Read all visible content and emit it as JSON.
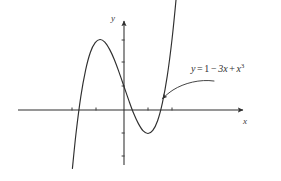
{
  "figure": {
    "title": "",
    "background_color": "#ffffff",
    "stroke_color": "#2f2f2f",
    "width": 281,
    "height": 181
  },
  "axes": {
    "x_label": "x",
    "y_label": "y",
    "origin_px": {
      "x": 124,
      "y": 110
    },
    "x_axis_px": {
      "start_x": 18,
      "end_x": 246,
      "y": 110
    },
    "y_axis_px": {
      "x": 124,
      "start_y": 165,
      "end_y": 18
    },
    "x_tick_px": [
      72,
      96,
      148,
      172
    ],
    "y_tick_px": [
      40,
      62,
      86,
      133,
      156
    ],
    "arrowheads": [
      "x-positive",
      "y-positive"
    ],
    "grid": false
  },
  "annotation": {
    "equation_text": "y = 1 - 3x + x^3",
    "lhs": "y",
    "equals": "=",
    "term_constant": "1",
    "term_linear": "3x",
    "term_cubic": "x",
    "cubic_exponent": "3",
    "minus_sign": "−",
    "plus_sign": "+",
    "pointer": "curved-arrow",
    "pointer_tip_px": {
      "x": 161,
      "y": 100
    }
  },
  "chart_data": {
    "type": "line",
    "title": "",
    "xlabel": "x",
    "ylabel": "y",
    "equation": "y = 1 - 3x + x^3",
    "grid": false,
    "legend": "none",
    "annotations": [
      {
        "text": "y = 1 - 3x + x^3",
        "x": 2.0,
        "y": 3.0
      }
    ],
    "xlim": [
      -2.3,
      2.6
    ],
    "ylim": [
      -3.4,
      4.0
    ],
    "features": {
      "local_max": {
        "x": -1,
        "y": 3
      },
      "local_min": {
        "x": 1,
        "y": -1
      },
      "y_intercept": {
        "x": 0,
        "y": 1
      },
      "inflection": {
        "x": 0,
        "y": 1
      }
    },
    "series": [
      {
        "name": "y = 1 - 3x + x^3",
        "color": "#2f2f2f",
        "x": [
          -2.15,
          -2.0,
          -1.8,
          -1.6,
          -1.4,
          -1.2,
          -1.0,
          -0.8,
          -0.6,
          -0.4,
          -0.2,
          0.0,
          0.2,
          0.4,
          0.6,
          0.8,
          1.0,
          1.2,
          1.4,
          1.6,
          1.8,
          2.0,
          2.2,
          2.35
        ],
        "y": [
          -2.49,
          -1.0,
          0.57,
          1.7,
          2.46,
          2.87,
          3.0,
          2.89,
          2.58,
          2.14,
          1.59,
          1.0,
          0.41,
          -0.14,
          -0.58,
          -0.89,
          -1.0,
          -0.87,
          -0.46,
          0.3,
          1.43,
          3.0,
          5.05,
          6.92
        ]
      }
    ]
  }
}
